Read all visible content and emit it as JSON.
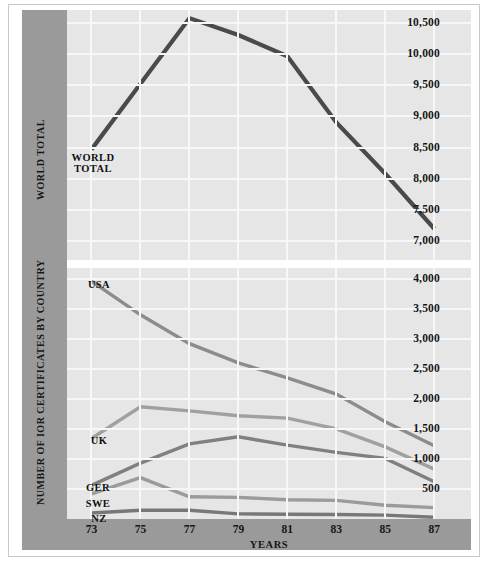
{
  "chart_data": [
    {
      "id": "world-total",
      "type": "line",
      "title": "",
      "xlabel": "",
      "ylabel": "WORLD TOTAL",
      "x": [
        73,
        75,
        77,
        79,
        81,
        83,
        85,
        87
      ],
      "xticklabels": [
        "73",
        "75",
        "77",
        "79",
        "81",
        "83",
        "85",
        "87"
      ],
      "yticklabels": [
        "10,500",
        "10,000",
        "9,500",
        "9,000",
        "8,500",
        "8,000",
        "7,500",
        "7,000"
      ],
      "ytickvalues": [
        10500,
        10000,
        9500,
        9000,
        8500,
        8000,
        7500,
        7000
      ],
      "ylim": [
        6700,
        10700
      ],
      "xlim": [
        72,
        88.5
      ],
      "grid": true,
      "legend": "inline-labels",
      "series": [
        {
          "name": "WORLD TOTAL",
          "label": "WORLD\nTOTAL",
          "color": "#4a4a4a",
          "values": [
            8470,
            9520,
            10570,
            10300,
            9960,
            8900,
            8080,
            7200
          ]
        }
      ]
    },
    {
      "id": "by-country",
      "type": "line",
      "title": "",
      "xlabel": "YEARS",
      "ylabel": "NUMBER OF IOR CERTIFICATES BY COUNTRY",
      "x": [
        73,
        75,
        77,
        79,
        81,
        83,
        85,
        87
      ],
      "xticklabels": [
        "73",
        "75",
        "77",
        "79",
        "81",
        "83",
        "85",
        "87"
      ],
      "yticklabels": [
        "4,000",
        "3,500",
        "3,000",
        "2,500",
        "2,000",
        "1,500",
        "1,000",
        "500"
      ],
      "ytickvalues": [
        4000,
        3500,
        3000,
        2500,
        2000,
        1500,
        1000,
        500
      ],
      "ylim": [
        0,
        4180
      ],
      "xlim": [
        72,
        88.5
      ],
      "grid": true,
      "legend": "inline-labels",
      "series": [
        {
          "name": "USA",
          "label": "USA",
          "color": "#8c8c8c",
          "values": [
            3960,
            3400,
            2920,
            2600,
            2350,
            2080,
            1620,
            1220
          ]
        },
        {
          "name": "UK",
          "label": "UK",
          "color": "#a0a0a0",
          "values": [
            1340,
            1870,
            1800,
            1720,
            1680,
            1500,
            1200,
            830
          ]
        },
        {
          "name": "GER",
          "label": "GER",
          "color": "#808080",
          "values": [
            560,
            930,
            1250,
            1370,
            1230,
            1110,
            1010,
            620
          ]
        },
        {
          "name": "SWE",
          "label": "SWE",
          "color": "#9b9b9b",
          "values": [
            420,
            690,
            370,
            360,
            320,
            310,
            230,
            190
          ]
        },
        {
          "name": "NZ",
          "label": "NZ",
          "color": "#787878",
          "values": [
            100,
            145,
            145,
            85,
            80,
            75,
            65,
            30
          ]
        }
      ]
    }
  ],
  "axes": {
    "top": {
      "yticks": [
        "10,500",
        "10,000",
        "9,500",
        "9,000",
        "8,500",
        "8,000",
        "7,500",
        "7,000"
      ],
      "title": "WORLD TOTAL"
    },
    "bottom": {
      "yticks": [
        "4,000",
        "3,500",
        "3,000",
        "2,500",
        "2,000",
        "1,500",
        "1,000",
        "500"
      ],
      "title": "NUMBER OF IOR CERTIFICATES BY COUNTRY"
    },
    "xticks": [
      "73",
      "75",
      "77",
      "79",
      "81",
      "83",
      "85",
      "87"
    ],
    "xtitle": "YEARS"
  },
  "labels": {
    "world_total_line1": "WORLD",
    "world_total_line2": "TOTAL",
    "usa": "USA",
    "uk": "UK",
    "ger": "GER",
    "swe": "SWE",
    "nz": "NZ"
  },
  "colors": {
    "panel_background": "#e6e6e6",
    "grid": "#f7f7f7",
    "axis_band": "#9a9a9a",
    "frame": "#c9c9c9",
    "world_total_line": "#4a4a4a",
    "usa_line": "#8c8c8c",
    "uk_line": "#a0a0a0",
    "ger_line": "#808080",
    "swe_line": "#9b9b9b",
    "nz_line": "#787878",
    "text": "#161616"
  }
}
